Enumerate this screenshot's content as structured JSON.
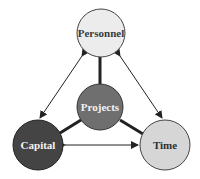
{
  "diagram": {
    "nodes": {
      "personnel": {
        "label": "Personnel",
        "fill": "#ececec",
        "text_color": "#3a3a3a"
      },
      "projects": {
        "label": "Projects",
        "fill": "#6f6f6f",
        "text_color": "#f2f2f2"
      },
      "capital": {
        "label": "Capital",
        "fill": "#444444",
        "text_color": "#f4f4f4"
      },
      "time": {
        "label": "Time",
        "fill": "#d6d6d6",
        "text_color": "#2f2f2f"
      }
    },
    "edges": [
      {
        "from": "personnel",
        "to": "capital",
        "type": "double-arrow"
      },
      {
        "from": "personnel",
        "to": "time",
        "type": "double-arrow"
      },
      {
        "from": "capital",
        "to": "time",
        "type": "double-arrow"
      },
      {
        "from": "projects",
        "to": "personnel",
        "type": "thick-line"
      },
      {
        "from": "projects",
        "to": "capital",
        "type": "thick-line"
      },
      {
        "from": "projects",
        "to": "time",
        "type": "thick-line"
      }
    ]
  }
}
